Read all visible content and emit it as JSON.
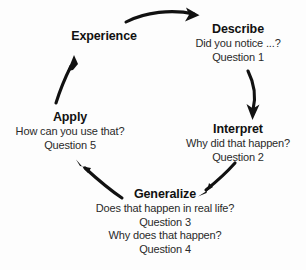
{
  "diagram": {
    "type": "cycle-diagram",
    "background_color": "#fdfdfd",
    "text_color": "#1a1a1a",
    "arrow_color": "#111111",
    "nodes": [
      {
        "id": "experience",
        "title": "Experience",
        "lines": []
      },
      {
        "id": "describe",
        "title": "Describe",
        "lines": [
          "Did you notice ...?",
          "Question 1"
        ]
      },
      {
        "id": "interpret",
        "title": "Interpret",
        "lines": [
          "Why did that happen?",
          "Question 2"
        ]
      },
      {
        "id": "generalize",
        "title": "Generalize",
        "lines": [
          "Does that happen in real life?",
          "Question 3",
          "Why does that happen?",
          "Question 4"
        ]
      },
      {
        "id": "apply",
        "title": "Apply",
        "lines": [
          "How can you use that?",
          "Question 5"
        ]
      }
    ],
    "arrows": [
      {
        "id": "experience-to-describe",
        "from": "experience",
        "to": "describe"
      },
      {
        "id": "describe-to-interpret",
        "from": "describe",
        "to": "interpret"
      },
      {
        "id": "interpret-to-generalize",
        "from": "interpret",
        "to": "generalize"
      },
      {
        "id": "generalize-to-apply",
        "from": "generalize",
        "to": "apply"
      },
      {
        "id": "apply-to-experience",
        "from": "apply",
        "to": "experience"
      }
    ]
  }
}
